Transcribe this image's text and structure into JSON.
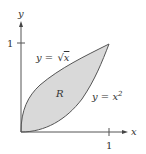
{
  "diagram": {
    "axes": {
      "x_label": "x",
      "y_label": "y",
      "x_tick": "1",
      "y_tick": "1"
    },
    "curves": [
      {
        "name": "sqrt",
        "label_lhs": "y = ",
        "label_rhs": "x",
        "label": "y = √x"
      },
      {
        "name": "square",
        "label_lhs": "y = x",
        "label_sup": "2",
        "label": "y = x²"
      }
    ],
    "region_label": "R",
    "colors": {
      "fill": "#d9d9d9",
      "stroke": "#555555",
      "axis": "#555555"
    }
  }
}
